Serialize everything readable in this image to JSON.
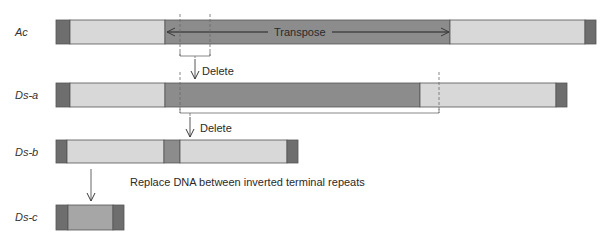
{
  "colors": {
    "cap": "#6e6e6e",
    "light": "#d8d8d8",
    "dark": "#8c8c8c",
    "medium": "#a6a6a6",
    "stroke": "#555555",
    "line": "#3a3a3a",
    "dashed": "#6a6a6a"
  },
  "rows": [
    {
      "label": "Ac"
    },
    {
      "label": "Ds-a"
    },
    {
      "label": "Ds-b"
    },
    {
      "label": "Ds-c"
    }
  ],
  "annotations": {
    "transpose": "Transpose",
    "delete1": "Delete",
    "delete2": "Delete",
    "replace": "Replace DNA between inverted terminal repeats"
  }
}
